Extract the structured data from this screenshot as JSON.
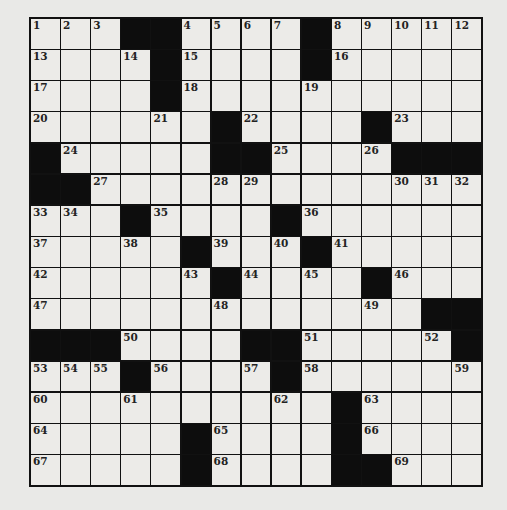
{
  "puzzle": {
    "size": {
      "rows": 15,
      "cols": 15
    },
    "colors": {
      "block": "#0d0d0d",
      "cell": "#ecebe8",
      "background": "#e9e9e7",
      "grid_line": "#111111"
    },
    "grid": [
      [
        "1",
        "2",
        "3",
        "#",
        "#",
        "4",
        "5",
        "6",
        "7",
        "#",
        "8",
        "9",
        "10",
        "11",
        "12"
      ],
      [
        "13",
        "",
        "",
        "14",
        "#",
        "15",
        "",
        "",
        "",
        "#",
        "16",
        "",
        "",
        "",
        ""
      ],
      [
        "17",
        "",
        "",
        "",
        "#",
        "18",
        "",
        "",
        "",
        "19",
        "",
        "",
        "",
        "",
        ""
      ],
      [
        "20",
        "",
        "",
        "",
        "21",
        "",
        "#",
        "22",
        "",
        "",
        "",
        "#",
        "23",
        "",
        ""
      ],
      [
        "#",
        "24",
        "",
        "",
        "",
        "",
        "#",
        "#",
        "25",
        "",
        "",
        "26",
        "#",
        "#",
        "#"
      ],
      [
        "#",
        "#",
        "27",
        "",
        "",
        "",
        "28",
        "29",
        "",
        "",
        "",
        "",
        "30",
        "31",
        "32"
      ],
      [
        "33",
        "34",
        "",
        "#",
        "35",
        "",
        "",
        "",
        "#",
        "36",
        "",
        "",
        "",
        "",
        ""
      ],
      [
        "37",
        "",
        "",
        "38",
        "",
        "#",
        "39",
        "",
        "40",
        "#",
        "41",
        "",
        "",
        "",
        ""
      ],
      [
        "42",
        "",
        "",
        "",
        "",
        "43",
        "#",
        "44",
        "",
        "45",
        "",
        "#",
        "46",
        "",
        ""
      ],
      [
        "47",
        "",
        "",
        "",
        "",
        "",
        "48",
        "",
        "",
        "",
        "",
        "49",
        "",
        "#",
        "#"
      ],
      [
        "#",
        "#",
        "#",
        "50",
        "",
        "",
        "",
        "#",
        "#",
        "51",
        "",
        "",
        "",
        "52",
        "#"
      ],
      [
        "53",
        "54",
        "55",
        "#",
        "56",
        "",
        "",
        "57",
        "#",
        "58",
        "",
        "",
        "",
        "",
        "59"
      ],
      [
        "60",
        "",
        "",
        "61",
        "",
        "",
        "",
        "",
        "62",
        "",
        "#",
        "63",
        "",
        "",
        ""
      ],
      [
        "64",
        "",
        "",
        "",
        "",
        "#",
        "65",
        "",
        "",
        "",
        "#",
        "66",
        "",
        "",
        ""
      ],
      [
        "67",
        "",
        "",
        "",
        "",
        "#",
        "68",
        "",
        "",
        "",
        "#",
        "#",
        "69",
        "",
        ""
      ]
    ]
  }
}
